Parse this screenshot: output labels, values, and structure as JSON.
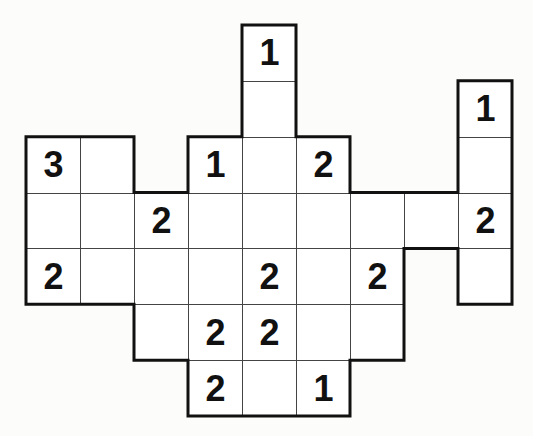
{
  "puzzle": {
    "grid_origin": {
      "x": 26,
      "y": 25
    },
    "cell_width": 54,
    "cell_height": 55.86,
    "cells": [
      {
        "r": 0,
        "c": 4,
        "v": "1"
      },
      {
        "r": 1,
        "c": 4,
        "v": ""
      },
      {
        "r": 1,
        "c": 8,
        "v": "1"
      },
      {
        "r": 2,
        "c": 0,
        "v": "3"
      },
      {
        "r": 2,
        "c": 1,
        "v": ""
      },
      {
        "r": 2,
        "c": 3,
        "v": "1"
      },
      {
        "r": 2,
        "c": 4,
        "v": ""
      },
      {
        "r": 2,
        "c": 5,
        "v": "2"
      },
      {
        "r": 2,
        "c": 8,
        "v": ""
      },
      {
        "r": 3,
        "c": 0,
        "v": ""
      },
      {
        "r": 3,
        "c": 1,
        "v": ""
      },
      {
        "r": 3,
        "c": 2,
        "v": "2"
      },
      {
        "r": 3,
        "c": 3,
        "v": ""
      },
      {
        "r": 3,
        "c": 4,
        "v": ""
      },
      {
        "r": 3,
        "c": 5,
        "v": ""
      },
      {
        "r": 3,
        "c": 6,
        "v": ""
      },
      {
        "r": 3,
        "c": 7,
        "v": ""
      },
      {
        "r": 3,
        "c": 8,
        "v": "2"
      },
      {
        "r": 4,
        "c": 0,
        "v": "2"
      },
      {
        "r": 4,
        "c": 1,
        "v": ""
      },
      {
        "r": 4,
        "c": 2,
        "v": ""
      },
      {
        "r": 4,
        "c": 3,
        "v": ""
      },
      {
        "r": 4,
        "c": 4,
        "v": "2"
      },
      {
        "r": 4,
        "c": 5,
        "v": ""
      },
      {
        "r": 4,
        "c": 6,
        "v": "2"
      },
      {
        "r": 4,
        "c": 8,
        "v": ""
      },
      {
        "r": 5,
        "c": 2,
        "v": ""
      },
      {
        "r": 5,
        "c": 3,
        "v": "2"
      },
      {
        "r": 5,
        "c": 4,
        "v": "2"
      },
      {
        "r": 5,
        "c": 5,
        "v": ""
      },
      {
        "r": 5,
        "c": 6,
        "v": ""
      },
      {
        "r": 6,
        "c": 3,
        "v": "2"
      },
      {
        "r": 6,
        "c": 4,
        "v": ""
      },
      {
        "r": 6,
        "c": 5,
        "v": "1"
      }
    ],
    "colors": {
      "background": "#fcfcfb",
      "cell": "#ffffff",
      "thin_line": "#444444",
      "outline": "#111111",
      "digit": "#111111"
    }
  }
}
